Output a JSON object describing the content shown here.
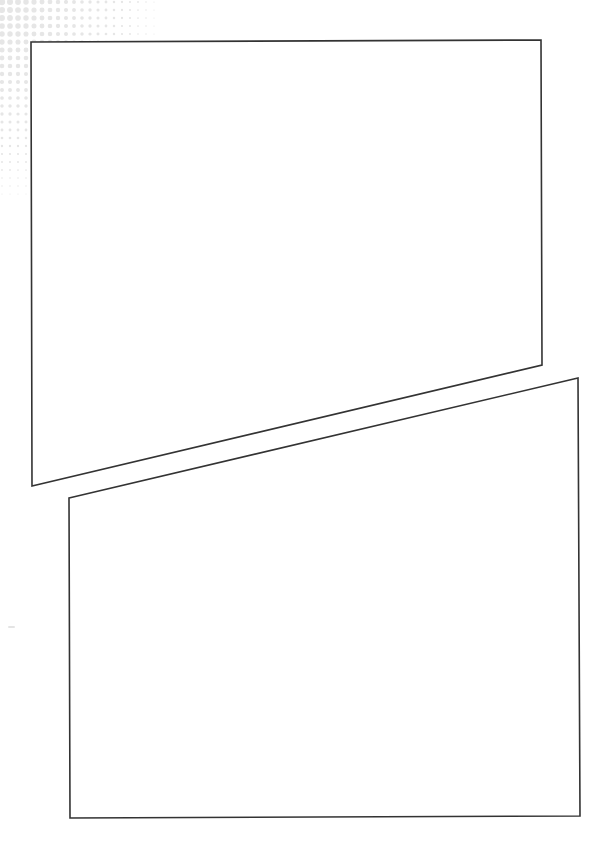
{
  "page": {
    "kind": "blank comic page template",
    "width": 603,
    "height": 841,
    "background_color": "#ffffff"
  },
  "decoration": {
    "name": "halftone-dot-pattern",
    "position": "top-left corner",
    "dot_color": "#e6e6e6"
  },
  "panels": [
    {
      "name": "panel-1",
      "content": "",
      "points": "31,42 541,40 542,365 32,486",
      "stroke_color": "#333333",
      "stroke_width": 1.6
    },
    {
      "name": "panel-2",
      "content": "",
      "points": "69,498 578,378 580,816 70,818",
      "stroke_color": "#333333",
      "stroke_width": 1.6
    }
  ]
}
